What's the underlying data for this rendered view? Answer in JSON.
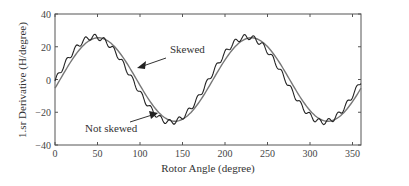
{
  "chart_data": {
    "type": "line",
    "title": "",
    "xlabel": "Rotor Angle (degree)",
    "ylabel": "1.sr Derivative (H/degree)",
    "xlim": [
      0,
      360
    ],
    "ylim": [
      -40,
      40
    ],
    "xticks": [
      0,
      50,
      100,
      150,
      200,
      250,
      300,
      350
    ],
    "yticks": [
      -40,
      -20,
      0,
      20,
      40
    ],
    "grid": false,
    "legend": null,
    "series": [
      {
        "name": "Skewed",
        "description": "smooth sinusoid, amplitude ~25, period 180 deg",
        "x": [
          0,
          10,
          20,
          30,
          40,
          50,
          60,
          70,
          80,
          90,
          100,
          110,
          120,
          130,
          140,
          150,
          160,
          170,
          180,
          190,
          200,
          210,
          220,
          230,
          240,
          250,
          260,
          270,
          280,
          290,
          300,
          310,
          320,
          330,
          340,
          350,
          360
        ],
        "values": [
          -3,
          5.5,
          13,
          19,
          23.5,
          25.5,
          24.5,
          21,
          15.5,
          8.5,
          0.5,
          -7.5,
          -14.5,
          -20.5,
          -24.5,
          -26,
          -24.5,
          -20,
          -13.5,
          -5.5,
          3,
          11,
          17.5,
          22.5,
          25.5,
          25.5,
          22.5,
          17.5,
          11,
          3,
          -5.5,
          -13.5,
          -20,
          -24.5,
          -26,
          -24.5,
          -3
        ]
      },
      {
        "name": "Not skewed",
        "description": "sinusoid with ripple, amplitude ~26, leads skewed curve by ~5 deg",
        "x": [
          0,
          10,
          20,
          30,
          40,
          50,
          60,
          70,
          80,
          90,
          100,
          110,
          120,
          130,
          140,
          150,
          160,
          170,
          180,
          190,
          200,
          210,
          220,
          230,
          240,
          250,
          260,
          270,
          280,
          290,
          300,
          310,
          320,
          330,
          340,
          350,
          360
        ],
        "values": [
          1,
          9,
          16,
          21,
          24.5,
          26,
          24,
          19,
          12,
          4,
          -4,
          -12,
          -18.5,
          -23.5,
          -26.5,
          -25.5,
          -22,
          -16,
          -8.5,
          -0.5,
          7.5,
          14.5,
          20,
          24,
          26,
          24.5,
          20.5,
          14.5,
          7,
          -1,
          -9,
          -16,
          -22,
          -26,
          -26.5,
          -20,
          4
        ]
      }
    ],
    "annotations": [
      {
        "text": "Skewed",
        "x": 135,
        "y": 11
      },
      {
        "text": "Not skewed",
        "x": 35,
        "y": -31
      }
    ]
  },
  "axes": {
    "xlabel": "Rotor Angle (degree)",
    "ylabel": "1.sr Derivative (H/degree)",
    "xtick_labels": [
      "0",
      "50",
      "100",
      "150",
      "200",
      "250",
      "300",
      "350"
    ],
    "ytick_labels": [
      "40",
      "20",
      "0",
      "−20",
      "−40"
    ]
  },
  "annotations": {
    "skewed": "Skewed",
    "not_skewed": "Not skewed"
  }
}
